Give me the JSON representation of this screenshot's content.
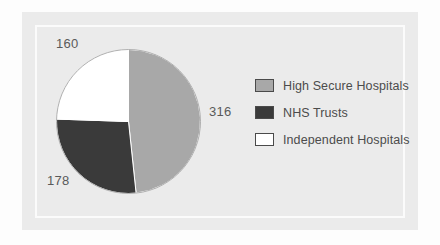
{
  "figure": {
    "background_color": "#fdfdfd",
    "panel_color": "#ebebeb",
    "inner_rule_color": "#fbfbfb"
  },
  "chart_data": {
    "type": "pie",
    "title": "",
    "subtitle": "",
    "xlabel": "",
    "ylabel": "",
    "grid": false,
    "legend_position": "right",
    "total": 654,
    "start_angle_deg": 0,
    "direction": "clockwise",
    "categories": [
      "High Secure Hospitals",
      "NHS Trusts",
      "Independent Hospitals"
    ],
    "values": [
      316,
      178,
      160
    ],
    "data_labels": [
      "316",
      "178",
      "160"
    ],
    "colors": [
      "#a8a8a8",
      "#3a3a3a",
      "#ffffff"
    ],
    "slices": [
      {
        "label": "High Secure Hospitals",
        "value": 316,
        "data_label": "316",
        "percent": 48.3,
        "color": "#a8a8a8",
        "start_deg": 0,
        "end_deg": 173.9
      },
      {
        "label": "NHS Trusts",
        "value": 178,
        "data_label": "178",
        "percent": 27.2,
        "color": "#3a3a3a",
        "start_deg": 173.9,
        "end_deg": 271.9
      },
      {
        "label": "Independent Hospitals",
        "value": 160,
        "data_label": "160",
        "percent": 24.5,
        "color": "#ffffff",
        "start_deg": 271.9,
        "end_deg": 360
      }
    ]
  },
  "legend": {
    "items": [
      {
        "label": "High Secure Hospitals",
        "color": "#a8a8a8"
      },
      {
        "label": "NHS Trusts",
        "color": "#3a3a3a"
      },
      {
        "label": "Independent Hospitals",
        "color": "#ffffff"
      }
    ]
  }
}
